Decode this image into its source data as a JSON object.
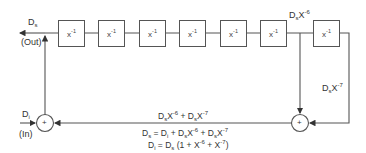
{
  "diagram": {
    "type": "block-diagram",
    "delay_boxes": [
      {
        "label": "x",
        "exp": "-1"
      },
      {
        "label": "x",
        "exp": "-1"
      },
      {
        "label": "x",
        "exp": "-1"
      },
      {
        "label": "x",
        "exp": "-1"
      },
      {
        "label": "x",
        "exp": "-1"
      },
      {
        "label": "x",
        "exp": "-1"
      },
      {
        "label": "x",
        "exp": "-1"
      }
    ],
    "output": {
      "symbol": "D",
      "sub": "s",
      "note": "(Out)"
    },
    "input": {
      "symbol": "D",
      "sub": "i",
      "note": "(In)"
    },
    "tap6": {
      "symbol": "D",
      "sub": "s",
      "var": "X",
      "exp": "-6"
    },
    "tap7": {
      "symbol": "D",
      "sub": "s",
      "var": "X",
      "exp": "-7"
    },
    "summers": [
      {
        "id": "left-summer",
        "symbol": "+"
      },
      {
        "id": "right-summer",
        "symbol": "+"
      }
    ],
    "feedback_label": {
      "t1": "D",
      "t1sub": "s",
      "t1var": "X",
      "t1exp": "-6",
      "plus": " + ",
      "t2": "D",
      "t2sub": "s",
      "t2var": "X",
      "t2exp": "-7"
    },
    "equations": {
      "eq1": {
        "lhs": "D",
        "lhssub": "s",
        "eqpart": " = D",
        "isub": "i",
        "mid": " + D",
        "m1sub": "s",
        "m1var": "X",
        "m1exp": "-6",
        "mid2": " + D",
        "m2sub": "s",
        "m2var": "X",
        "m2exp": "-7"
      },
      "eq2": {
        "lhs": "D",
        "lhssub": "i",
        "eqpart": " = D",
        "ssub": "s",
        "open": " (1 + X",
        "e1": "-6",
        "plus": " + X",
        "e2": "-7",
        "close": ")"
      }
    }
  }
}
